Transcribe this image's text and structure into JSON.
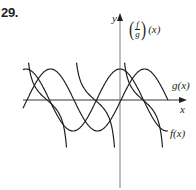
{
  "problem": {
    "number": "29."
  },
  "axes": {
    "x_label": "x",
    "y_label": "y"
  },
  "labels": {
    "quotient": {
      "paren_open": "(",
      "numerator": "f",
      "denominator": "g",
      "paren_close": ")",
      "argument": "(x)"
    },
    "g": "g(x)",
    "f": "f(x)"
  },
  "colors": {
    "ink": "#231f20",
    "axis": "#6d6e71"
  },
  "curves": [
    {
      "name": "g(x)",
      "shape": "cosine-like",
      "peak_at_y_axis": true
    },
    {
      "name": "f(x)",
      "shape": "sine-like",
      "shifted_right_of": "g(x)"
    },
    {
      "name": "(f/g)(x)",
      "shape": "tangent-like branches with vertical asymptotes",
      "branch_count": 3
    }
  ]
}
